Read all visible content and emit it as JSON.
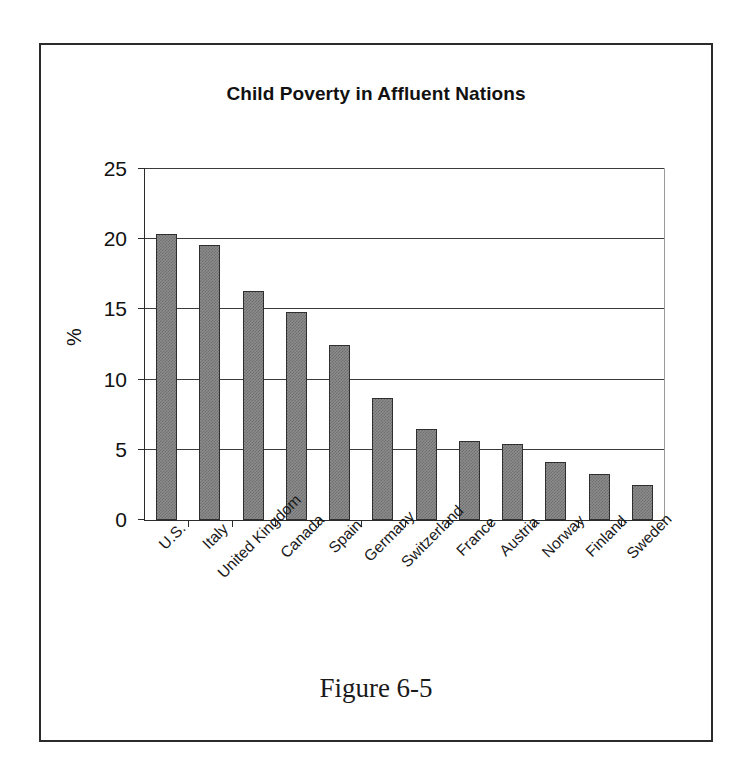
{
  "figure": {
    "caption": "Figure 6-5",
    "frame_color": "#2b2b2b",
    "background": "#ffffff"
  },
  "chart_data": {
    "type": "bar",
    "title": "Child Poverty in Affluent Nations",
    "xlabel": "",
    "ylabel": "%",
    "ylim": [
      0,
      25
    ],
    "yticks": [
      0,
      5,
      10,
      15,
      20,
      25
    ],
    "ytick_labels": [
      "0",
      "5",
      "10",
      "15",
      "20",
      "25"
    ],
    "grid": true,
    "legend": false,
    "bar_color": "#8c8c8c",
    "bar_edge_color": "#2f2f2f",
    "categories": [
      "U.S.",
      "Italy",
      "United Kingdom",
      "Canada",
      "Spain",
      "Germany",
      "Switzerland",
      "France",
      "Austria",
      "Norway",
      "Finland",
      "Sweden"
    ],
    "values": [
      20.4,
      19.6,
      16.3,
      14.8,
      12.5,
      8.7,
      6.5,
      5.6,
      5.4,
      4.1,
      3.3,
      2.5
    ]
  }
}
